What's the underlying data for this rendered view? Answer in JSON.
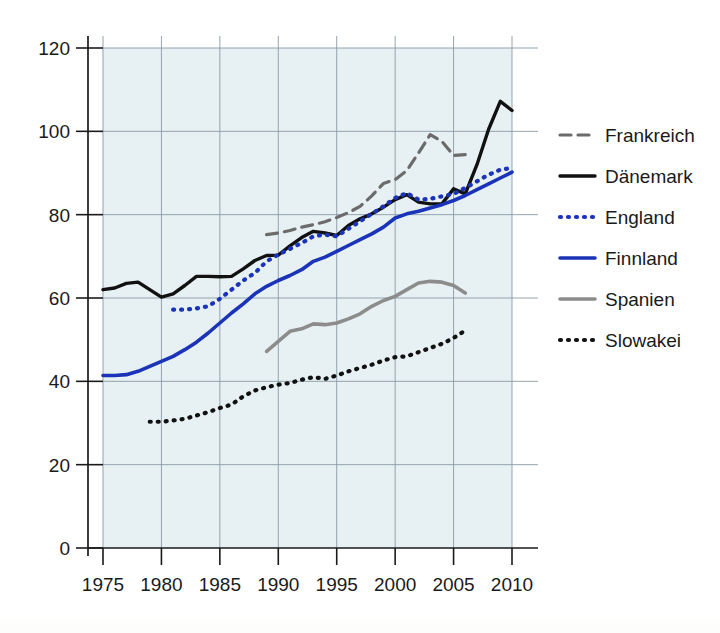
{
  "chart_data": {
    "type": "line",
    "title": "",
    "subtitle": "",
    "xlabel": "",
    "ylabel": "",
    "xlim": [
      1973,
      2012
    ],
    "ylim": [
      0,
      120
    ],
    "xticks": [
      1975,
      1980,
      1985,
      1990,
      1995,
      2000,
      2005,
      2010
    ],
    "yticks": [
      0,
      20,
      40,
      60,
      80,
      100,
      120
    ],
    "xtick_labels": [
      "1975",
      "1980",
      "1985",
      "1990",
      "1995",
      "2000",
      "2005",
      "2010"
    ],
    "ytick_labels": [
      "0",
      "20",
      "40",
      "60",
      "80",
      "100",
      "120"
    ],
    "grid": true,
    "legend_position": "right",
    "plot_background": "#e7f1f4",
    "series": [
      {
        "name": "Frankreich",
        "color": "#6b6b6b",
        "style": "dashed",
        "width": 3.2,
        "dasharray": "11,7",
        "x": [
          1989,
          1990,
          1991,
          1992,
          1993,
          1994,
          1995,
          1996,
          1997,
          1998,
          1999,
          2000,
          2001,
          2002,
          2003,
          2004,
          2005,
          2006
        ],
        "values": [
          75.2,
          75.6,
          76.2,
          77.0,
          77.6,
          78.3,
          79.3,
          80.5,
          82.0,
          84.5,
          87.5,
          88.4,
          90.6,
          94.8,
          99.2,
          97.6,
          94.2,
          94.4
        ]
      },
      {
        "name": "Dänemark",
        "color": "#111111",
        "style": "solid",
        "width": 3.4,
        "dasharray": "",
        "x": [
          1975,
          1976,
          1977,
          1978,
          1979,
          1980,
          1981,
          1982,
          1983,
          1984,
          1985,
          1986,
          1987,
          1988,
          1989,
          1990,
          1991,
          1992,
          1993,
          1994,
          1995,
          1996,
          1997,
          1998,
          1999,
          2000,
          2001,
          2002,
          2003,
          2004,
          2005,
          2006,
          2007,
          2008,
          2009,
          2010
        ],
        "values": [
          62.0,
          62.4,
          63.5,
          63.8,
          62.0,
          60.2,
          61.0,
          63.0,
          65.2,
          65.2,
          65.1,
          65.2,
          67.0,
          69.0,
          70.2,
          70.3,
          72.5,
          74.5,
          76.0,
          75.6,
          75.0,
          77.4,
          79.0,
          80.2,
          81.8,
          83.6,
          84.8,
          83.0,
          82.6,
          82.6,
          86.2,
          85.0,
          92.0,
          100.5,
          107.2,
          105.0
        ]
      },
      {
        "name": "England",
        "color": "#1a33b8",
        "style": "dotted",
        "width": 4.2,
        "dasharray": "1,7",
        "x": [
          1981,
          1982,
          1983,
          1984,
          1985,
          1986,
          1987,
          1988,
          1989,
          1990,
          1991,
          1992,
          1993,
          1994,
          1995,
          1996,
          1997,
          1998,
          1999,
          2000,
          2001,
          2002,
          2003,
          2004,
          2005,
          2006,
          2007,
          2008,
          2009,
          2010
        ],
        "values": [
          57.2,
          57.2,
          57.5,
          58.0,
          59.8,
          62.0,
          64.2,
          66.0,
          68.8,
          70.4,
          71.8,
          73.2,
          74.8,
          75.2,
          74.8,
          76.6,
          78.4,
          80.2,
          82.0,
          84.0,
          85.2,
          83.6,
          83.8,
          84.4,
          85.0,
          86.4,
          88.0,
          89.6,
          90.8,
          91.2
        ]
      },
      {
        "name": "Finnland",
        "color": "#1a33b8",
        "style": "solid",
        "width": 3.6,
        "dasharray": "",
        "x": [
          1975,
          1976,
          1977,
          1978,
          1979,
          1980,
          1981,
          1982,
          1983,
          1984,
          1985,
          1986,
          1987,
          1988,
          1989,
          1990,
          1991,
          1992,
          1993,
          1994,
          1995,
          1996,
          1997,
          1998,
          1999,
          2000,
          2001,
          2002,
          2003,
          2004,
          2005,
          2006,
          2007,
          2008,
          2009,
          2010
        ],
        "values": [
          41.4,
          41.4,
          41.6,
          42.4,
          43.6,
          44.8,
          46.0,
          47.6,
          49.4,
          51.6,
          54.0,
          56.4,
          58.6,
          61.0,
          62.8,
          64.2,
          65.4,
          66.8,
          68.8,
          69.8,
          71.2,
          72.6,
          74.0,
          75.4,
          77.0,
          79.2,
          80.2,
          80.8,
          81.6,
          82.4,
          83.4,
          84.6,
          86.0,
          87.4,
          88.8,
          90.2
        ]
      },
      {
        "name": "Spanien",
        "color": "#8c8c8c",
        "style": "solid",
        "width": 3.6,
        "dasharray": "",
        "x": [
          1989,
          1990,
          1991,
          1992,
          1993,
          1994,
          1995,
          1996,
          1997,
          1998,
          1999,
          2000,
          2001,
          2002,
          2003,
          2004,
          2005,
          2006
        ],
        "values": [
          47.2,
          49.6,
          52.0,
          52.6,
          53.8,
          53.6,
          54.0,
          55.0,
          56.2,
          58.0,
          59.4,
          60.4,
          62.0,
          63.6,
          64.0,
          63.8,
          63.0,
          61.2
        ]
      },
      {
        "name": "Slowakei",
        "color": "#111111",
        "style": "dotted",
        "width": 4.2,
        "dasharray": "1,7",
        "x": [
          1979,
          1980,
          1981,
          1982,
          1983,
          1984,
          1985,
          1986,
          1987,
          1988,
          1989,
          1990,
          1991,
          1992,
          1993,
          1994,
          1995,
          1996,
          1997,
          1998,
          1999,
          2000,
          2001,
          2002,
          2003,
          2004,
          2005,
          2006
        ],
        "values": [
          30.3,
          30.3,
          30.6,
          31.0,
          31.8,
          32.6,
          33.6,
          34.4,
          36.4,
          37.8,
          38.6,
          39.2,
          39.6,
          40.4,
          41.0,
          40.6,
          41.4,
          42.4,
          43.2,
          44.0,
          45.0,
          45.8,
          46.0,
          47.0,
          48.0,
          49.0,
          50.4,
          52.2
        ]
      }
    ]
  },
  "legend": {
    "entries": [
      {
        "label": "Frankreich"
      },
      {
        "label": "Dänemark"
      },
      {
        "label": "England"
      },
      {
        "label": "Finnland"
      },
      {
        "label": "Spanien"
      },
      {
        "label": "Slowakei"
      }
    ]
  }
}
